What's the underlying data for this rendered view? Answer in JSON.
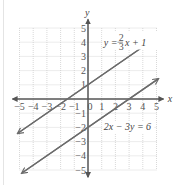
{
  "chart_data": {
    "type": "line",
    "title": "",
    "xlabel": "x",
    "ylabel": "y",
    "xlim": [
      -5,
      5
    ],
    "ylim": [
      -5,
      5
    ],
    "grid": true,
    "x_ticks": [
      "-5",
      "-4",
      "-3",
      "-2",
      "-1",
      "0",
      "1",
      "2",
      "3",
      "4",
      "5"
    ],
    "y_ticks": [
      "-5",
      "-4",
      "-3",
      "-2",
      "-1",
      "1",
      "2",
      "3",
      "4",
      "5"
    ],
    "series": [
      {
        "name": "y = (2/3)x + 1",
        "label_main": "y = ",
        "label_num": "2",
        "label_den": "3",
        "label_tail": "x + 1",
        "slope": 0.6667,
        "intercept": 1,
        "x": [
          -5.1,
          5.1
        ],
        "y": [
          -2.4,
          4.4
        ],
        "color": "#6b6b6b"
      },
      {
        "name": "2x − 3y = 6",
        "label": "2x − 3y = 6",
        "slope": 0.6667,
        "intercept": -2,
        "x": [
          -4.8,
          5.1
        ],
        "y": [
          -5.2,
          1.4
        ],
        "color": "#6b6b6b"
      }
    ]
  }
}
